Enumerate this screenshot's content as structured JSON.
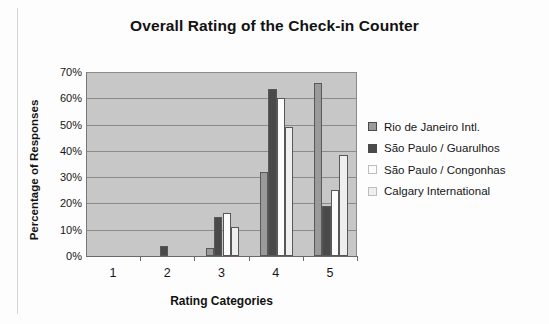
{
  "chart_data": {
    "type": "bar",
    "title": "Overall Rating of the Check-in Counter",
    "xlabel": "Rating Categories",
    "ylabel": "Percentage of Responses",
    "categories": [
      "1",
      "2",
      "3",
      "4",
      "5"
    ],
    "ylim": [
      0,
      70
    ],
    "ytick_labels": [
      "0%",
      "10%",
      "20%",
      "30%",
      "40%",
      "50%",
      "60%",
      "70%"
    ],
    "ytick_values": [
      0,
      10,
      20,
      30,
      40,
      50,
      60,
      70
    ],
    "grid": true,
    "legend_position": "right",
    "series": [
      {
        "name": "Rio de Janeiro Intl.",
        "color": "#9a9a9a",
        "values": [
          0,
          0,
          3,
          32,
          66
        ]
      },
      {
        "name": "São Paulo / Guarulhos",
        "color": "#4a4a4a",
        "values": [
          0,
          4,
          15,
          63.5,
          19
        ]
      },
      {
        "name": "São Paulo / Congonhas",
        "color": "#fdfdfd",
        "values": [
          0,
          0,
          16.5,
          60,
          25
        ]
      },
      {
        "name": "Calgary International",
        "color": "#efefef",
        "values": [
          0,
          0,
          11,
          49,
          38.5
        ]
      }
    ]
  },
  "style": {
    "plot_background": "#c7c7c7",
    "gridline_color": "#8a8a8a",
    "axis_color": "#6a6a6a",
    "text_color": "#161616"
  }
}
